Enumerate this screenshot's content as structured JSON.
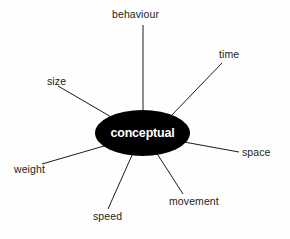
{
  "diagram": {
    "type": "radial-spoke",
    "background_color": "#fefefe",
    "center": {
      "label": "conceptual",
      "shape": "ellipse",
      "fill_color": "#000000",
      "text_color": "#ffffff",
      "cx": 142.5,
      "cy": 133,
      "rx": 47.5,
      "ry": 23
    },
    "line_color": "#1c1c1c",
    "label_color": "#1c1c1c",
    "spokes": [
      {
        "label": "behaviour",
        "label_x": 112,
        "label_y": 9,
        "line": {
          "x1": 143,
          "y1": 25,
          "x2": 143,
          "y2": 112
        }
      },
      {
        "label": "time",
        "label_x": 219,
        "label_y": 49,
        "line": {
          "x1": 222,
          "y1": 63,
          "x2": 169,
          "y2": 118
        }
      },
      {
        "label": "size",
        "label_x": 47,
        "label_y": 76,
        "line": {
          "x1": 58,
          "y1": 86,
          "x2": 113,
          "y2": 118
        }
      },
      {
        "label": "space",
        "label_x": 242,
        "label_y": 147,
        "line": {
          "x1": 184,
          "y1": 142,
          "x2": 239,
          "y2": 152
        }
      },
      {
        "label": "weight",
        "label_x": 14,
        "label_y": 164,
        "line": {
          "x1": 42,
          "y1": 164,
          "x2": 104,
          "y2": 146
        }
      },
      {
        "label": "speed",
        "label_x": 93,
        "label_y": 211,
        "line": {
          "x1": 108,
          "y1": 209,
          "x2": 133,
          "y2": 153
        }
      },
      {
        "label": "movement",
        "label_x": 169,
        "label_y": 196,
        "line": {
          "x1": 183,
          "y1": 194,
          "x2": 156,
          "y2": 152
        }
      }
    ]
  }
}
